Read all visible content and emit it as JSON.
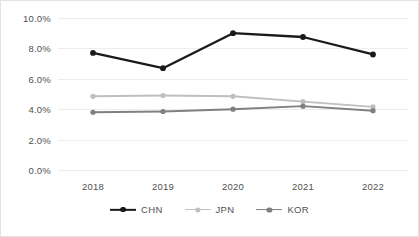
{
  "chart_data": {
    "type": "line",
    "title": "",
    "xlabel": "",
    "ylabel": "",
    "categories": [
      "2018",
      "2019",
      "2020",
      "2021",
      "2022"
    ],
    "ylim": [
      0,
      10
    ],
    "yticks": [
      "0.0%",
      "2.0%",
      "4.0%",
      "6.0%",
      "8.0%",
      "10.0%"
    ],
    "ytick_values": [
      0,
      2,
      4,
      6,
      8,
      10
    ],
    "grid": true,
    "legend_position": "bottom",
    "series": [
      {
        "name": "CHN",
        "color": "#1a1a1a",
        "values": [
          7.7,
          6.7,
          9.0,
          8.75,
          7.6
        ]
      },
      {
        "name": "JPN",
        "color": "#bfbfbf",
        "values": [
          4.85,
          4.9,
          4.85,
          4.5,
          4.15
        ]
      },
      {
        "name": "KOR",
        "color": "#808080",
        "values": [
          3.8,
          3.85,
          4.0,
          4.2,
          3.9
        ]
      }
    ]
  }
}
